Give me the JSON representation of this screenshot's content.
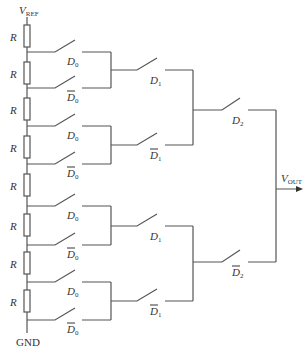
{
  "diagram": {
    "type": "resistor-string DAC with switch tree",
    "colors": {
      "wire": "#555555",
      "text": "#333333",
      "background": "#ffffff"
    },
    "supply": {
      "top_label": "V",
      "top_sub": "REF",
      "bottom_label": "GND"
    },
    "resistor_label": "R",
    "resistors": [
      {
        "label": "R"
      },
      {
        "label": "R"
      },
      {
        "label": "R"
      },
      {
        "label": "R"
      },
      {
        "label": "R"
      },
      {
        "label": "R"
      },
      {
        "label": "R"
      },
      {
        "label": "R"
      }
    ],
    "level0_switches": [
      {
        "label": "D",
        "sub": "0",
        "bar": false
      },
      {
        "label": "D",
        "sub": "0",
        "bar": true
      },
      {
        "label": "D",
        "sub": "0",
        "bar": false
      },
      {
        "label": "D",
        "sub": "0",
        "bar": true
      },
      {
        "label": "D",
        "sub": "0",
        "bar": false
      },
      {
        "label": "D",
        "sub": "0",
        "bar": true
      },
      {
        "label": "D",
        "sub": "0",
        "bar": false
      },
      {
        "label": "D",
        "sub": "0",
        "bar": true
      }
    ],
    "level1_switches": [
      {
        "label": "D",
        "sub": "1",
        "bar": false
      },
      {
        "label": "D",
        "sub": "1",
        "bar": true
      },
      {
        "label": "D",
        "sub": "1",
        "bar": false
      },
      {
        "label": "D",
        "sub": "1",
        "bar": true
      }
    ],
    "level2_switches": [
      {
        "label": "D",
        "sub": "2",
        "bar": false
      },
      {
        "label": "D",
        "sub": "2",
        "bar": true
      }
    ],
    "output": {
      "label": "V",
      "sub": "OUT"
    }
  }
}
